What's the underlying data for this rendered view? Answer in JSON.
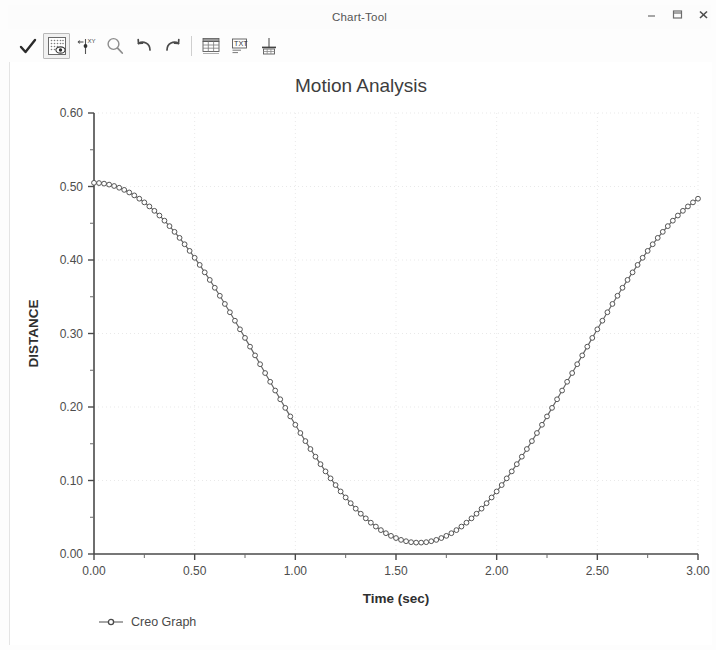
{
  "window": {
    "title": "Chart-Tool",
    "controls": [
      {
        "name": "minimize-button",
        "glyph": "minimize"
      },
      {
        "name": "maximize-button",
        "glyph": "maximize"
      },
      {
        "name": "close-button",
        "glyph": "close"
      }
    ]
  },
  "toolbar": {
    "items": [
      {
        "name": "accept-check-icon",
        "label": "Accept",
        "active": false
      },
      {
        "name": "graph-display-icon",
        "label": "Graph Display",
        "active": true
      },
      {
        "name": "point-marker-icon",
        "label": "Point Marker",
        "active": false
      },
      {
        "name": "zoom-magnifier-icon",
        "label": "Zoom",
        "active": false
      },
      {
        "name": "undo-icon",
        "label": "Undo",
        "active": false
      },
      {
        "name": "redo-icon",
        "label": "Redo",
        "active": false
      },
      {
        "name": "table-icon",
        "label": "Table",
        "active": false
      },
      {
        "name": "text-table-icon",
        "label": "Text Table",
        "active": false
      },
      {
        "name": "export-grid-icon",
        "label": "Export",
        "active": false
      }
    ]
  },
  "chart_data": {
    "type": "line",
    "title": "Motion Analysis",
    "xlabel": "Time (sec)",
    "ylabel": "DISTANCE",
    "xlim": [
      0.0,
      3.0
    ],
    "ylim": [
      0.0,
      0.6
    ],
    "grid": true,
    "legend_position": "bottom-left",
    "x_ticks": [
      "0.00",
      "0.50",
      "1.00",
      "1.50",
      "2.00",
      "2.50",
      "3.00"
    ],
    "x_tick_values": [
      0.0,
      0.5,
      1.0,
      1.5,
      2.0,
      2.5,
      3.0
    ],
    "x_minor_step": 0.25,
    "y_ticks": [
      "0.00",
      "0.10",
      "0.20",
      "0.30",
      "0.40",
      "0.50",
      "0.60"
    ],
    "y_tick_values": [
      0.0,
      0.1,
      0.2,
      0.3,
      0.4,
      0.5,
      0.6
    ],
    "y_minor_step": 0.05,
    "series": [
      {
        "name": "Creo Graph",
        "color": "#666666",
        "marker": "circle",
        "x": [
          0.0,
          0.025,
          0.05,
          0.075,
          0.1,
          0.125,
          0.15,
          0.175,
          0.2,
          0.225,
          0.25,
          0.275,
          0.3,
          0.325,
          0.35,
          0.375,
          0.4,
          0.425,
          0.45,
          0.475,
          0.5,
          0.525,
          0.55,
          0.575,
          0.6,
          0.625,
          0.65,
          0.675,
          0.7,
          0.725,
          0.75,
          0.775,
          0.8,
          0.825,
          0.85,
          0.875,
          0.9,
          0.925,
          0.95,
          0.975,
          1.0,
          1.025,
          1.05,
          1.075,
          1.1,
          1.125,
          1.15,
          1.175,
          1.2,
          1.225,
          1.25,
          1.275,
          1.3,
          1.325,
          1.35,
          1.375,
          1.4,
          1.425,
          1.45,
          1.475,
          1.5,
          1.525,
          1.55,
          1.575,
          1.6,
          1.625,
          1.65,
          1.675,
          1.7,
          1.725,
          1.75,
          1.775,
          1.8,
          1.825,
          1.85,
          1.875,
          1.9,
          1.925,
          1.95,
          1.975,
          2.0,
          2.025,
          2.05,
          2.075,
          2.1,
          2.125,
          2.15,
          2.175,
          2.2,
          2.225,
          2.25,
          2.275,
          2.3,
          2.325,
          2.35,
          2.375,
          2.4,
          2.425,
          2.45,
          2.475,
          2.5,
          2.525,
          2.55,
          2.575,
          2.6,
          2.625,
          2.65,
          2.675,
          2.7,
          2.725,
          2.75,
          2.775,
          2.8,
          2.825,
          2.85,
          2.875,
          2.9,
          2.925,
          2.95,
          2.975,
          3.0
        ],
        "y": [
          0.505,
          0.5047,
          0.5039,
          0.5026,
          0.5007,
          0.4983,
          0.4954,
          0.4919,
          0.4879,
          0.4834,
          0.4784,
          0.4729,
          0.4669,
          0.4605,
          0.4535,
          0.4461,
          0.4383,
          0.4301,
          0.4214,
          0.4124,
          0.403,
          0.3933,
          0.3832,
          0.3729,
          0.3622,
          0.3513,
          0.3402,
          0.3289,
          0.3174,
          0.3057,
          0.294,
          0.2821,
          0.2702,
          0.2582,
          0.2462,
          0.2343,
          0.2224,
          0.2105,
          0.1988,
          0.1872,
          0.1758,
          0.1646,
          0.1536,
          0.1428,
          0.1324,
          0.1222,
          0.1124,
          0.1029,
          0.0938,
          0.0851,
          0.0769,
          0.0691,
          0.0617,
          0.0548,
          0.0485,
          0.0426,
          0.0373,
          0.0325,
          0.0283,
          0.0247,
          0.0217,
          0.0192,
          0.0174,
          0.0161,
          0.0155,
          0.0155,
          0.0161,
          0.0174,
          0.0192,
          0.0217,
          0.0247,
          0.0283,
          0.0325,
          0.0373,
          0.0426,
          0.0485,
          0.0548,
          0.0617,
          0.0691,
          0.0769,
          0.0851,
          0.0938,
          0.1029,
          0.1124,
          0.1222,
          0.1324,
          0.1428,
          0.1536,
          0.1646,
          0.1758,
          0.1872,
          0.1988,
          0.2105,
          0.2224,
          0.2343,
          0.2462,
          0.2582,
          0.2702,
          0.2821,
          0.294,
          0.3057,
          0.3174,
          0.3289,
          0.3402,
          0.3513,
          0.3622,
          0.3729,
          0.3832,
          0.3933,
          0.403,
          0.4124,
          0.4214,
          0.4301,
          0.4383,
          0.4461,
          0.4535,
          0.4605,
          0.4669,
          0.4729,
          0.4784,
          0.4834
        ]
      }
    ]
  },
  "legend": {
    "label": "Creo Graph"
  }
}
